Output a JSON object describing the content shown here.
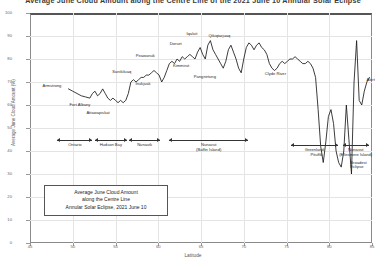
{
  "chart_data": {
    "type": "line",
    "title": "Average June Cloud Amount along the Centre Line of the 2021 June 10 Annular Solar Eclipse",
    "xlabel": "Latitude",
    "ylabel": "Average June Cloud Amount (%)",
    "xlim": [
      45,
      85
    ],
    "ylim": [
      0,
      100
    ],
    "xticks": [
      45,
      50,
      55,
      60,
      65,
      70,
      75,
      80,
      85
    ],
    "yticks": [
      0,
      10,
      20,
      30,
      40,
      50,
      60,
      70,
      80,
      90,
      100
    ],
    "grid": true,
    "legend_position": "none",
    "series_name": "Average June Cloud Amount",
    "x": [
      49.5,
      50.0,
      50.5,
      51.0,
      51.5,
      52.0,
      52.3,
      52.6,
      52.9,
      53.2,
      53.5,
      53.8,
      54.1,
      54.4,
      54.7,
      55.0,
      55.3,
      55.6,
      55.9,
      56.2,
      56.5,
      56.8,
      57.1,
      57.4,
      57.7,
      58.0,
      58.3,
      58.6,
      58.9,
      59.2,
      59.5,
      59.8,
      60.1,
      60.4,
      60.7,
      61.0,
      61.3,
      61.6,
      61.9,
      62.2,
      62.5,
      62.8,
      63.1,
      63.4,
      63.7,
      64.0,
      64.3,
      64.6,
      64.9,
      65.2,
      65.5,
      65.8,
      66.1,
      66.4,
      66.7,
      67.0,
      67.3,
      67.6,
      67.9,
      68.2,
      68.5,
      68.8,
      69.1,
      69.4,
      69.7,
      70.0,
      70.3,
      70.6,
      70.9,
      71.2,
      71.5,
      71.8,
      72.1,
      72.4,
      72.7,
      73.0,
      73.3,
      73.6,
      73.9,
      74.2,
      74.5,
      74.8,
      75.1,
      75.4,
      75.7,
      76.0,
      76.3,
      76.6,
      76.9,
      77.2,
      77.5,
      77.8,
      78.1,
      78.4,
      78.7,
      79.0,
      79.3,
      79.6,
      79.9,
      80.2,
      80.5,
      80.8,
      81.1,
      81.4,
      81.7,
      82.0,
      82.3,
      82.6,
      82.9,
      83.2,
      83.5,
      83.8,
      84.1,
      84.4,
      84.7
    ],
    "y": [
      67,
      66,
      65,
      64,
      63.5,
      63,
      65,
      66,
      64,
      65,
      67,
      65,
      63,
      62,
      63,
      62,
      61,
      62,
      61,
      62,
      65,
      70,
      71,
      70,
      71,
      72,
      72,
      73,
      73,
      74,
      75,
      74,
      73,
      70,
      72,
      75,
      78,
      79,
      78,
      80,
      79,
      81,
      80,
      81,
      82,
      81,
      80,
      83,
      85,
      82,
      80,
      86,
      88,
      84,
      82,
      80,
      78,
      76,
      79,
      84,
      86,
      83,
      80,
      76,
      74,
      80,
      85,
      87,
      86,
      84,
      86,
      87,
      85,
      84,
      82,
      78,
      76,
      75,
      76,
      78,
      79,
      78,
      79,
      80,
      80,
      81,
      80,
      79,
      78,
      78,
      79,
      78,
      76,
      72,
      58,
      42,
      35,
      44,
      55,
      58,
      52,
      40,
      35,
      33,
      40,
      60,
      45,
      30,
      70,
      88,
      62,
      60,
      66,
      70,
      72
    ],
    "point_labels": [
      {
        "name": "Armstrong",
        "x": 49.5,
        "y": 67
      },
      {
        "name": "Fort Albany",
        "x": 52.2,
        "y": 62
      },
      {
        "name": "Attawapiskat",
        "x": 53.0,
        "y": 60
      },
      {
        "name": "Sanikiluaq",
        "x": 56.5,
        "y": 72
      },
      {
        "name": "Peawanuk",
        "x": 59.0,
        "y": 79
      },
      {
        "name": "Inukjuak",
        "x": 58.5,
        "y": 72
      },
      {
        "name": "Dorset",
        "x": 62.5,
        "y": 84
      },
      {
        "name": "Iqaluit",
        "x": 64.0,
        "y": 88
      },
      {
        "name": "Kimmirut",
        "x": 62.9,
        "y": 80
      },
      {
        "name": "Qikiqtarjuaq",
        "x": 67.5,
        "y": 87
      },
      {
        "name": "Pangnirtung",
        "x": 65.8,
        "y": 76
      },
      {
        "name": "Clyde River",
        "x": 72.0,
        "y": 75
      },
      {
        "name": "Pituffik",
        "x": 78.5,
        "y": 42
      },
      {
        "name": "Broadest Eclipse",
        "x": 82.0,
        "y": 36
      },
      {
        "name": "Alert",
        "x": 84.0,
        "y": 70
      }
    ],
    "regions": [
      {
        "label": "Ontario",
        "x0": 48.2,
        "x1": 52.3
      },
      {
        "label": "Hudson Bay",
        "x0": 52.6,
        "x1": 56.3
      },
      {
        "label": "Nunavik",
        "x0": 56.6,
        "x1": 60.2
      },
      {
        "label": "Nunavut (Baffin Island)",
        "x0": 61.3,
        "x1": 70.5
      },
      {
        "label": "Greenland",
        "x0": 75.5,
        "x1": 81.0
      },
      {
        "label": "Nunavut (Ellesmere Island)",
        "x0": 81.6,
        "x1": 84.6
      }
    ]
  },
  "legend_box": {
    "line1": "Average June Cloud Amount",
    "line2": "along the Centre Line",
    "line3": "Annular Solar Eclipse, 2021 June 10"
  },
  "colors": {
    "curve": "#1a1a1a",
    "grid": "#e4e4e4",
    "frame": "#8a8a8a",
    "text": "#333333"
  }
}
